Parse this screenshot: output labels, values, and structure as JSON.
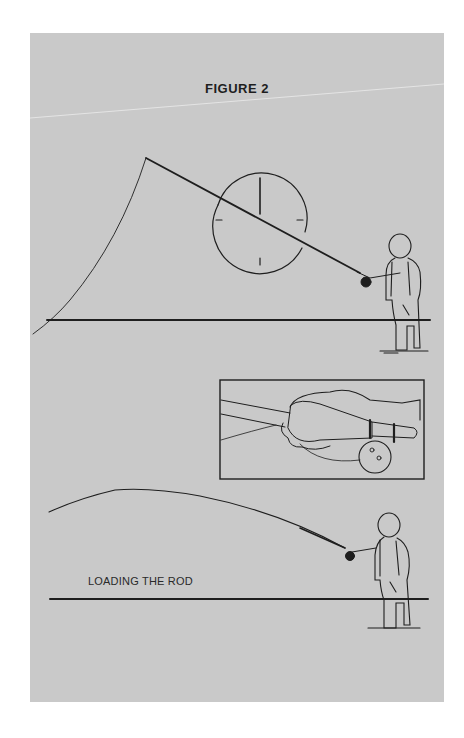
{
  "figure": {
    "title": "FIGURE 2",
    "caption": "LOADING THE ROD",
    "panel_color": "#c9c9c9",
    "ink_color": "#1e1e1e",
    "illustrations": [
      {
        "name": "casting-stance",
        "description": "Angler holding rod back with clock-face reference circle; fly line arcs down to water"
      },
      {
        "name": "grip-inset",
        "description": "Close-up of hand gripping cork rod handle with reel below"
      },
      {
        "name": "loading-the-rod",
        "description": "Angler with bent rod as line loads forward"
      }
    ]
  }
}
